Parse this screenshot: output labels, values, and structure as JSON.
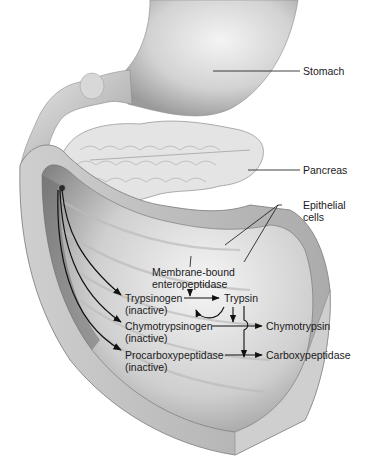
{
  "diagram": {
    "type": "anatomical-illustration",
    "structures": {
      "stomach": "Stomach",
      "pancreas": "Pancreas",
      "epithelial_cells": [
        "Epithelial",
        "cells"
      ]
    },
    "enzyme": {
      "line1": "Membrane-bound",
      "line2": "enteropeptidase"
    },
    "proenzymes": [
      {
        "name": "Trypsinogen",
        "state": "(inactive)",
        "product": "Trypsin"
      },
      {
        "name": "Chymotrypsinogen",
        "state": "(inactive)",
        "product": "Chymotrypsin"
      },
      {
        "name": "Procarboxypeptidase",
        "state": "(inactive)",
        "product": "Carboxypeptidase"
      }
    ],
    "colors": {
      "background": "#ffffff",
      "tissue_light": "#e6e6e6",
      "tissue_mid": "#bdbdbd",
      "tissue_dark": "#7a7a7a",
      "line": "#111111",
      "text": "#1a1a1a"
    }
  }
}
